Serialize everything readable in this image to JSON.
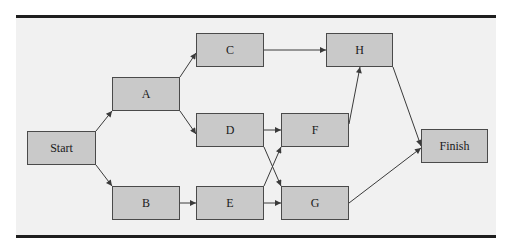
{
  "diagram": {
    "type": "network-precedence-diagram",
    "colors": {
      "panel_background": "#f1f1f1",
      "node_fill": "#c9c9c9",
      "node_border": "#4a4a4a",
      "edge": "#3a3a3a",
      "rule": "#1e1e1e"
    },
    "nodes": [
      {
        "id": "start",
        "label": "Start"
      },
      {
        "id": "A",
        "label": "A"
      },
      {
        "id": "B",
        "label": "B"
      },
      {
        "id": "C",
        "label": "C"
      },
      {
        "id": "D",
        "label": "D"
      },
      {
        "id": "E",
        "label": "E"
      },
      {
        "id": "F",
        "label": "F"
      },
      {
        "id": "G",
        "label": "G"
      },
      {
        "id": "H",
        "label": "H"
      },
      {
        "id": "finish",
        "label": "Finish"
      }
    ],
    "edges": [
      {
        "from": "Start",
        "to": "A"
      },
      {
        "from": "Start",
        "to": "B"
      },
      {
        "from": "A",
        "to": "C"
      },
      {
        "from": "A",
        "to": "D"
      },
      {
        "from": "B",
        "to": "E"
      },
      {
        "from": "C",
        "to": "H"
      },
      {
        "from": "D",
        "to": "F"
      },
      {
        "from": "D",
        "to": "G"
      },
      {
        "from": "E",
        "to": "F"
      },
      {
        "from": "E",
        "to": "G"
      },
      {
        "from": "F",
        "to": "H"
      },
      {
        "from": "H",
        "to": "Finish"
      },
      {
        "from": "G",
        "to": "Finish"
      }
    ]
  }
}
